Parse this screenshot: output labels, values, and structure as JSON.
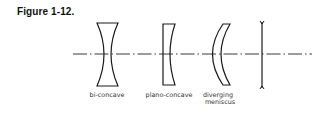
{
  "figure": {
    "title": "Figure 1-12."
  },
  "diagram": {
    "type": "optical-lens-diagram",
    "optical_axis": "dash-dot line",
    "lenses": [
      {
        "type": "bi-concave",
        "label": "bi-concave"
      },
      {
        "type": "plano-concave",
        "label": "plano-concave"
      },
      {
        "type": "diverging-meniscus",
        "label_line1": "diverging",
        "label_line2": "meniscus"
      },
      {
        "type": "thin-negative-lens-symbol",
        "label": ""
      }
    ],
    "stroke_color": "#1a1a1a",
    "background": "#ffffff"
  }
}
